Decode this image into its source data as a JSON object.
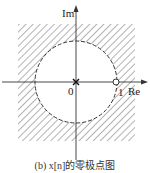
{
  "diagram": {
    "type": "pole-zero plot",
    "axes": {
      "x_label": "Re",
      "y_label": "Im",
      "origin_label": "0",
      "tick_label": "1"
    },
    "unit_circle": {
      "style": "dashed",
      "radius": 1
    },
    "poles": [
      {
        "re": 0,
        "im": 0,
        "marker": "x"
      }
    ],
    "zeros": [
      {
        "re": 1,
        "im": 0,
        "marker": "o"
      }
    ],
    "roc": "hatched region outside unit circle",
    "caption": "(b) x[n]的零极点图"
  }
}
